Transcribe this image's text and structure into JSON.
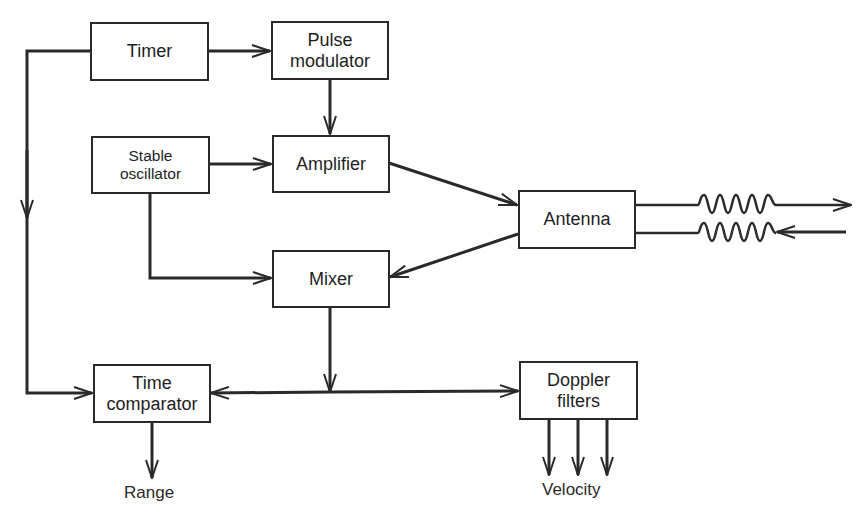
{
  "diagram": {
    "type": "block-diagram",
    "colors": {
      "stroke": "#2a2a2a",
      "background": "#ffffff"
    },
    "blocks": {
      "timer": {
        "label": "Timer"
      },
      "pulse_modulator": {
        "line1": "Pulse",
        "line2": "modulator"
      },
      "stable_oscillator": {
        "line1": "Stable",
        "line2": "oscillator"
      },
      "amplifier": {
        "label": "Amplifier"
      },
      "antenna": {
        "label": "Antenna"
      },
      "mixer": {
        "label": "Mixer"
      },
      "time_comparator": {
        "line1": "Time",
        "line2": "comparator"
      },
      "doppler_filters": {
        "line1": "Doppler",
        "line2": "filters"
      }
    },
    "outputs": {
      "range": "Range",
      "velocity": "Velocity"
    },
    "connections": [
      {
        "from": "Timer",
        "to": "Pulse modulator"
      },
      {
        "from": "Timer",
        "to": "Time comparator"
      },
      {
        "from": "Pulse modulator",
        "to": "Amplifier"
      },
      {
        "from": "Stable oscillator",
        "to": "Amplifier"
      },
      {
        "from": "Stable oscillator",
        "to": "Mixer"
      },
      {
        "from": "Amplifier",
        "to": "Antenna"
      },
      {
        "from": "Antenna",
        "to": "Mixer"
      },
      {
        "from": "Antenna",
        "to": "transmitted wave (outgoing)"
      },
      {
        "from": "received wave (incoming)",
        "to": "Antenna"
      },
      {
        "from": "Mixer",
        "to": "Time comparator"
      },
      {
        "from": "Mixer",
        "to": "Doppler filters"
      },
      {
        "from": "Time comparator",
        "to": "Range"
      },
      {
        "from": "Doppler filters",
        "to": "Velocity",
        "count": 3
      }
    ]
  }
}
